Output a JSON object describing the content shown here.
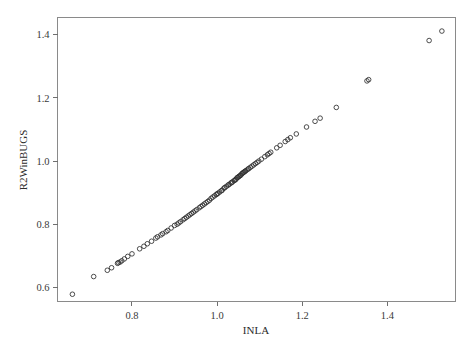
{
  "figure": {
    "kind": "scatter-plot",
    "background_color": "#ffffff",
    "frame_color": "#8a8a8a",
    "point_color": "#2e2e2e",
    "point_shape": "open-circle"
  },
  "chart_data": {
    "type": "scatter",
    "title": "",
    "xlabel": "INLA",
    "ylabel": "R2WinBUGS",
    "xlim": [
      0.625,
      1.56
    ],
    "ylim": [
      0.555,
      1.455
    ],
    "xticks": [
      0.8,
      1.0,
      1.2,
      1.4
    ],
    "xtick_labels": [
      "0.8",
      "1.0",
      "1.2",
      "1.4"
    ],
    "yticks": [
      0.6,
      0.8,
      1.0,
      1.2,
      1.4
    ],
    "ytick_labels": [
      "0.6",
      "0.8",
      "1.0",
      "1.2",
      "1.4"
    ],
    "grid": false,
    "legend": null,
    "n_points": 101,
    "relationship": "near-identity, y approximately equals x",
    "x": [
      0.66,
      0.71,
      0.742,
      0.752,
      0.766,
      0.768,
      0.772,
      0.776,
      0.782,
      0.79,
      0.8,
      0.818,
      0.828,
      0.836,
      0.846,
      0.856,
      0.86,
      0.868,
      0.872,
      0.88,
      0.884,
      0.892,
      0.9,
      0.906,
      0.91,
      0.914,
      0.92,
      0.924,
      0.928,
      0.932,
      0.936,
      0.94,
      0.944,
      0.948,
      0.952,
      0.958,
      0.962,
      0.966,
      0.97,
      0.974,
      0.978,
      0.982,
      0.986,
      0.99,
      0.994,
      0.998,
      1.0,
      1.002,
      1.006,
      1.01,
      1.012,
      1.016,
      1.018,
      1.022,
      1.026,
      1.028,
      1.032,
      1.034,
      1.036,
      1.04,
      1.042,
      1.044,
      1.046,
      1.048,
      1.05,
      1.052,
      1.054,
      1.056,
      1.058,
      1.06,
      1.062,
      1.064,
      1.066,
      1.068,
      1.072,
      1.074,
      1.078,
      1.082,
      1.086,
      1.09,
      1.094,
      1.098,
      1.104,
      1.112,
      1.118,
      1.122,
      1.126,
      1.14,
      1.148,
      1.16,
      1.166,
      1.172,
      1.186,
      1.21,
      1.23,
      1.242,
      1.28,
      1.352,
      1.356,
      1.498,
      1.528
    ],
    "y": [
      0.578,
      0.634,
      0.654,
      0.662,
      0.676,
      0.678,
      0.68,
      0.684,
      0.69,
      0.698,
      0.706,
      0.722,
      0.73,
      0.738,
      0.746,
      0.756,
      0.76,
      0.766,
      0.77,
      0.776,
      0.78,
      0.788,
      0.796,
      0.8,
      0.804,
      0.808,
      0.814,
      0.818,
      0.822,
      0.826,
      0.83,
      0.834,
      0.838,
      0.842,
      0.846,
      0.852,
      0.856,
      0.86,
      0.864,
      0.868,
      0.872,
      0.876,
      0.882,
      0.886,
      0.89,
      0.894,
      0.896,
      0.898,
      0.902,
      0.906,
      0.908,
      0.914,
      0.916,
      0.92,
      0.924,
      0.926,
      0.93,
      0.932,
      0.934,
      0.938,
      0.94,
      0.942,
      0.946,
      0.948,
      0.95,
      0.952,
      0.954,
      0.956,
      0.96,
      0.962,
      0.964,
      0.966,
      0.968,
      0.97,
      0.974,
      0.976,
      0.98,
      0.984,
      0.988,
      0.992,
      0.996,
      1.0,
      1.006,
      1.014,
      1.02,
      1.024,
      1.028,
      1.042,
      1.05,
      1.062,
      1.068,
      1.074,
      1.086,
      1.108,
      1.126,
      1.136,
      1.17,
      1.254,
      1.258,
      1.382,
      1.412
    ]
  }
}
